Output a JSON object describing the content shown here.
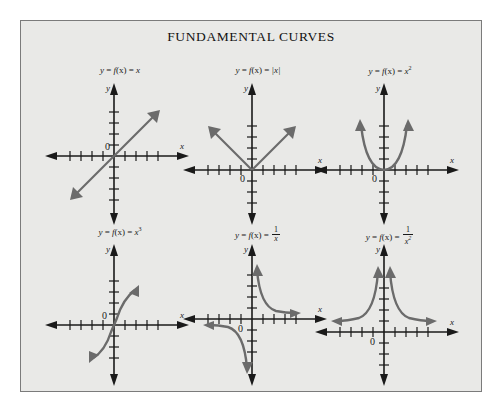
{
  "figure": {
    "title": "FUNDAMENTAL CURVES",
    "background_color": "#e9e9e7",
    "border_color": "#7b7b7b",
    "axis_color": "#1a1a1a",
    "curve_color": "#6b6b6b",
    "page_color": "#ffffff"
  },
  "axes": {
    "x_label": "x",
    "y_label": "y",
    "origin_label": "0",
    "ticks_per_side": 4,
    "tick_spacing_px": 11,
    "arrowheads": "both ends of both axes"
  },
  "panels": [
    {
      "id": "identity",
      "label_plain": "y = f(x) = x",
      "label_parts": {
        "y": "y",
        "eq1": "=",
        "f": "f",
        "arg": "(x)",
        "eq2": "=",
        "rhs": "x"
      },
      "expression": "x",
      "curve_type": "line",
      "description": "Straight line through the origin with slope 1, arrowheads at both ends",
      "row": 1,
      "col": 1
    },
    {
      "id": "absolute-value",
      "label_plain": "y = f(x) = |x|",
      "label_parts": {
        "y": "y",
        "eq1": "=",
        "f": "f",
        "arg": "(x)",
        "eq2": "=",
        "rhs": "|x|"
      },
      "expression": "|x|",
      "curve_type": "v-shape",
      "description": "V shape with vertex at the origin, both rays rising with arrowheads",
      "row": 1,
      "col": 2
    },
    {
      "id": "square",
      "label_plain": "y = f(x) = x²",
      "label_parts": {
        "y": "y",
        "eq1": "=",
        "f": "f",
        "arg": "(x)",
        "eq2": "=",
        "rhs": "x",
        "exponent": "2"
      },
      "expression": "x^2",
      "curve_type": "parabola",
      "description": "Upward parabola with vertex at the origin, arrowheads on both branches",
      "row": 1,
      "col": 3
    },
    {
      "id": "cube",
      "label_plain": "y = f(x) = x³",
      "label_parts": {
        "y": "y",
        "eq1": "=",
        "f": "f",
        "arg": "(x)",
        "eq2": "=",
        "rhs": "x",
        "exponent": "3"
      },
      "expression": "x^3",
      "curve_type": "cubic",
      "description": "S-shaped cubic through the origin, arrowheads lower-left and upper-right",
      "row": 2,
      "col": 1
    },
    {
      "id": "reciprocal",
      "label_plain": "y = f(x) = 1/x",
      "label_parts": {
        "y": "y",
        "eq1": "=",
        "f": "f",
        "arg": "(x)",
        "eq2": "=",
        "numerator": "1",
        "denominator": "x"
      },
      "expression": "1/x",
      "curve_type": "hyperbola",
      "description": "Hyperbola with branches in quadrant I and quadrant III, asymptotic to both axes",
      "row": 2,
      "col": 2
    },
    {
      "id": "reciprocal-square",
      "label_plain": "y = f(x) = 1/x²",
      "label_parts": {
        "y": "y",
        "eq1": "=",
        "f": "f",
        "arg": "(x)",
        "eq2": "=",
        "numerator": "1",
        "denominator": "x",
        "denominator_exponent": "2"
      },
      "expression": "1/x^2",
      "curve_type": "even-hyperbola",
      "description": "Two branches above the x-axis, both rising along the y-axis, asymptotic to both axes",
      "row": 2,
      "col": 3
    }
  ]
}
